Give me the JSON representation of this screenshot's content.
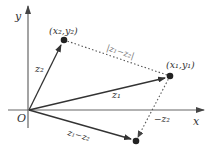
{
  "diagram": {
    "axes": {
      "x_label": "x",
      "y_label": "y",
      "origin_label": "O"
    },
    "points": {
      "z1": {
        "coord_label": "(x₁,y₁)",
        "vector_label": "z₁"
      },
      "z2": {
        "coord_label": "(x₂,y₂)",
        "vector_label": "z₂"
      },
      "diff": {
        "vector_label": "z₁−z₂"
      }
    },
    "dotted_labels": {
      "distance": "|z₁−z₂|",
      "neg_z2": "−z₂"
    },
    "colors": {
      "stroke": "#333333",
      "axis": "#555555",
      "dotted": "#555555",
      "background": "#ffffff"
    }
  }
}
